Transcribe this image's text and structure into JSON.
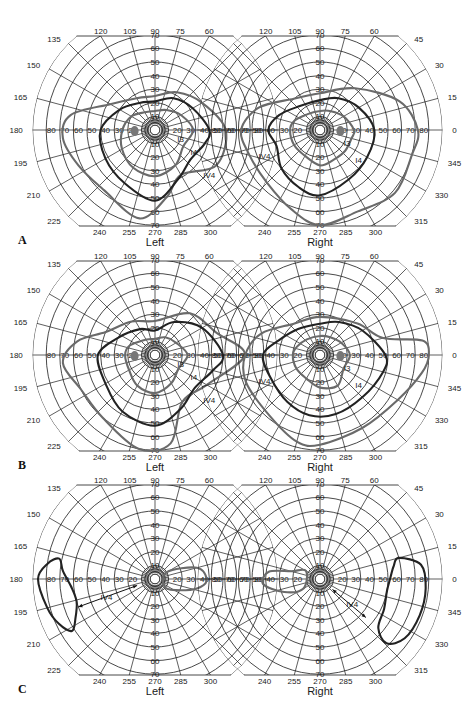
{
  "figure": {
    "panels": [
      {
        "letter": "A",
        "left_label": "Left",
        "right_label": "Right",
        "left_isopter_labels": [
          "I3",
          "I4",
          "IV4"
        ],
        "right_isopter_labels": [
          "I3",
          "I4",
          "IV4"
        ]
      },
      {
        "letter": "B",
        "left_label": "Left",
        "right_label": "Right",
        "left_isopter_labels": [
          "I3",
          "I4",
          "IV4"
        ],
        "right_isopter_labels": [
          "I3",
          "I4",
          "IV4"
        ]
      },
      {
        "letter": "C",
        "left_label": "Left",
        "right_label": "Right",
        "left_isopter_labels": [
          "IV4"
        ],
        "right_isopter_labels": [
          "IV4"
        ]
      }
    ],
    "meridian_labels": {
      "top": [
        "120",
        "105",
        "90",
        "75",
        "60"
      ],
      "left_side": [
        "135",
        "150",
        "165",
        "180",
        "195",
        "210",
        "225"
      ],
      "right_side": [
        "45",
        "30",
        "15",
        "0",
        "345",
        "330",
        "315"
      ],
      "bottom": [
        "240",
        "255",
        "270",
        "285",
        "300"
      ]
    },
    "eccentricity_labels": [
      "10",
      "20",
      "30",
      "40",
      "50",
      "60",
      "70",
      "80"
    ],
    "colors": {
      "grid": "#1a1a1a",
      "isopter_dark": "#222222",
      "isopter_gray": "#6a6a6a",
      "blind_spot": "#777777",
      "background": "#ffffff"
    }
  }
}
